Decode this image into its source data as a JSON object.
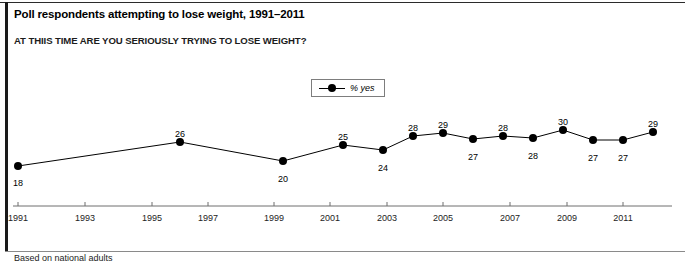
{
  "title": "Poll respondents attempting to lose weight, 1991–2011",
  "subtitle": "AT THIIS TIME ARE YOU SERIOUSLY TRYING TO LOSE WEIGHT?",
  "footnote": "Based on national adults",
  "legend": {
    "label": "% yes",
    "marker": "line-with-dot-marker",
    "position": "top-center"
  },
  "colors": {
    "line": "#000000",
    "marker": "#000000",
    "axis": "#6e6e6e",
    "text": "#000000",
    "frame": "#1a1a1a",
    "background": "#ffffff"
  },
  "chart_data": {
    "type": "line",
    "title": "Poll respondents attempting to lose weight, 1991–2011",
    "subtitle": "AT THIIS TIME ARE YOU SERIOUSLY TRYING TO LOSE WEIGHT?",
    "xlabel": "",
    "ylabel": "",
    "grid": false,
    "legend_position": "top-center",
    "xlim": [
      1991,
      2012
    ],
    "ylim": [
      0,
      40
    ],
    "xticks": [
      1991,
      1993,
      1995,
      1997,
      1999,
      2001,
      2003,
      2005,
      2007,
      2009,
      2011
    ],
    "xticklabels": [
      "1991",
      "1993",
      "1995",
      "1997",
      "1999",
      "2001",
      "2003",
      "2005",
      "2007",
      "2009",
      "2011"
    ],
    "series": [
      {
        "name": "% yes",
        "x": [
          1991,
          1996,
          2000,
          2002,
          2003,
          2004,
          2005,
          2006,
          2007,
          2008,
          2009,
          2010,
          2011,
          2012
        ],
        "values": [
          18,
          26,
          20,
          25,
          24,
          28,
          29,
          27,
          28,
          28,
          30,
          27,
          27,
          29
        ],
        "point_labels": [
          "18",
          "26",
          "20",
          "25",
          "24",
          "28",
          "29",
          "27",
          "28",
          "28",
          "30",
          "27",
          "27",
          "29"
        ],
        "label_positions": [
          "below",
          "above",
          "below",
          "above",
          "below",
          "above",
          "above",
          "below",
          "above",
          "below",
          "above",
          "below",
          "below",
          "above"
        ]
      }
    ]
  },
  "points_px": [
    {
      "label": "18",
      "x": 18,
      "y": 166,
      "lx": 18,
      "ly": 178,
      "pos": "below"
    },
    {
      "label": "26",
      "x": 180,
      "y": 142,
      "lx": 180,
      "ly": 129,
      "pos": "above"
    },
    {
      "label": "20",
      "x": 283,
      "y": 161,
      "lx": 283,
      "ly": 174,
      "pos": "below"
    },
    {
      "label": "25",
      "x": 343,
      "y": 145,
      "lx": 343,
      "ly": 132,
      "pos": "above"
    },
    {
      "label": "24",
      "x": 383,
      "y": 150,
      "lx": 383,
      "ly": 163,
      "pos": "below"
    },
    {
      "label": "28",
      "x": 413,
      "y": 136,
      "lx": 413,
      "ly": 123,
      "pos": "above"
    },
    {
      "label": "29",
      "x": 443,
      "y": 133,
      "lx": 443,
      "ly": 120,
      "pos": "above"
    },
    {
      "label": "27",
      "x": 473,
      "y": 139,
      "lx": 473,
      "ly": 152,
      "pos": "below"
    },
    {
      "label": "28",
      "x": 503,
      "y": 136,
      "lx": 503,
      "ly": 123,
      "pos": "above"
    },
    {
      "label": "28",
      "x": 533,
      "y": 138,
      "lx": 533,
      "ly": 151,
      "pos": "below"
    },
    {
      "label": "30",
      "x": 563,
      "y": 130,
      "lx": 563,
      "ly": 117,
      "pos": "above"
    },
    {
      "label": "27",
      "x": 593,
      "y": 140,
      "lx": 593,
      "ly": 153,
      "pos": "below"
    },
    {
      "label": "27",
      "x": 623,
      "y": 140,
      "lx": 623,
      "ly": 153,
      "pos": "below"
    },
    {
      "label": "29",
      "x": 653,
      "y": 132,
      "lx": 653,
      "ly": 119,
      "pos": "above"
    }
  ],
  "xaxis_px": {
    "y": 206,
    "x_start": 13,
    "x_end": 672,
    "ticks": [
      {
        "label": "1991",
        "x": 18
      },
      {
        "label": "1993",
        "x": 85
      },
      {
        "label": "1995",
        "x": 152
      },
      {
        "label": "1997",
        "x": 208
      },
      {
        "label": "1999",
        "x": 274
      },
      {
        "label": "2001",
        "x": 330
      },
      {
        "label": "2003",
        "x": 387
      },
      {
        "label": "2005",
        "x": 443
      },
      {
        "label": "2007",
        "x": 510
      },
      {
        "label": "2009",
        "x": 567
      },
      {
        "label": "2011",
        "x": 623
      }
    ],
    "tick_label_y": 213
  }
}
